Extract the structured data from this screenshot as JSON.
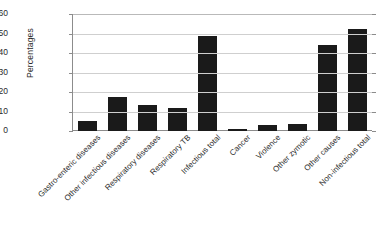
{
  "chart_data": {
    "type": "bar",
    "title": "",
    "xlabel": "",
    "ylabel": "Percentages",
    "ylim": [
      0,
      60
    ],
    "yticks": [
      0,
      10,
      20,
      30,
      40,
      50,
      60
    ],
    "grid": true,
    "legend": "none",
    "bar_color": "#1a1a1a",
    "categories": [
      "Gastro-enteric diseases",
      "Other infectious diseases",
      "Respiratory diseases",
      "Respiratory TB",
      "Infectious total",
      "Cancer",
      "Violence",
      "Other zymotic",
      "Other causes",
      "Non-infectious total"
    ],
    "values": [
      5,
      17.5,
      13.5,
      12,
      48.5,
      1,
      3,
      3.5,
      44,
      52.5
    ]
  }
}
